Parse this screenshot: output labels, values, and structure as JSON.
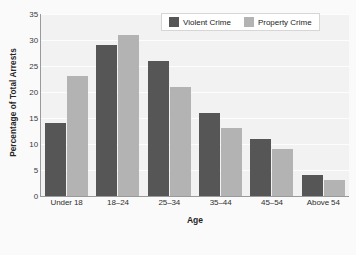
{
  "chart_data": {
    "type": "bar",
    "title": "",
    "subtitle": "",
    "xlabel": "Age",
    "ylabel": "Percentage of Total Arrests",
    "categories": [
      "Under 18",
      "18–24",
      "25–34",
      "35–44",
      "45–54",
      "Above 54"
    ],
    "series": [
      {
        "name": "Violent Crime",
        "color": "#565656",
        "values": [
          14,
          29,
          26,
          16,
          11,
          4
        ]
      },
      {
        "name": "Property Crime",
        "color": "#b3b3b3",
        "values": [
          23,
          31,
          21,
          13,
          9,
          3
        ]
      }
    ],
    "ylim": [
      0,
      35
    ],
    "ytick_labels": [
      "35",
      "30",
      "25",
      "20",
      "15",
      "10",
      "5",
      "0"
    ],
    "ytick_values": [
      35,
      30,
      25,
      20,
      15,
      10,
      5,
      0
    ],
    "grid": true,
    "grid_color": "#ffffff",
    "legend_position": "top-right",
    "plot_background": "#f2f2f2",
    "figure_background": "#fafafa",
    "axis_color": "#9a9a9a"
  },
  "legend": {
    "items": [
      {
        "label": "Violent Crime",
        "swatch": "violent-crime-swatch"
      },
      {
        "label": "Property Crime",
        "swatch": "property-crime-swatch"
      }
    ]
  }
}
